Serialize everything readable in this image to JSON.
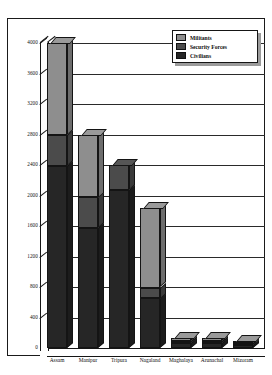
{
  "chart_data": {
    "type": "bar",
    "subtype": "stacked-3d-column",
    "title": "",
    "xlabel": "",
    "ylabel": "",
    "ylim": [
      0,
      4000
    ],
    "ytick_step": 400,
    "ytick_labels": [
      "4000",
      "3600",
      "3200",
      "2800",
      "2400",
      "2000",
      "1600",
      "1200",
      "800",
      "400",
      "0"
    ],
    "grid": true,
    "legend_position": "top-right",
    "categories": [
      "Assam",
      "Manipur",
      "Tripura",
      "Nagaland",
      "Maghalaya",
      "Arunachal",
      "Mizoram"
    ],
    "series": [
      {
        "name": "Civilians",
        "color": "#262626",
        "values": [
          2390,
          1570,
          2070,
          650,
          60,
          60,
          40
        ]
      },
      {
        "name": "Security Forces",
        "color": "#4b4b4b",
        "values": [
          410,
          410,
          330,
          140,
          30,
          30,
          20
        ]
      },
      {
        "name": "Militants",
        "color": "#8e8e8e",
        "values": [
          1200,
          820,
          0,
          1040,
          40,
          40,
          30
        ]
      }
    ],
    "totals": [
      4000,
      2800,
      2400,
      1830,
      130,
      130,
      90
    ]
  },
  "legend": {
    "items": [
      {
        "label": "Militants",
        "swatch": "#8e8e8e"
      },
      {
        "label": "Security Forces",
        "swatch": "#4b4b4b"
      },
      {
        "label": "Civilians",
        "swatch": "#262626"
      }
    ]
  }
}
